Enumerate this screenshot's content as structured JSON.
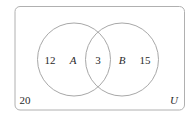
{
  "diagram": {
    "type": "venn",
    "universe_label": "U",
    "sets": [
      {
        "name": "A",
        "only_count": "12"
      },
      {
        "name": "B",
        "only_count": "15"
      }
    ],
    "intersection_count": "3",
    "outside_count": "20"
  },
  "colors": {
    "stroke": "#a8a8a8",
    "text": "#2a2a2a",
    "background": "#ffffff"
  }
}
